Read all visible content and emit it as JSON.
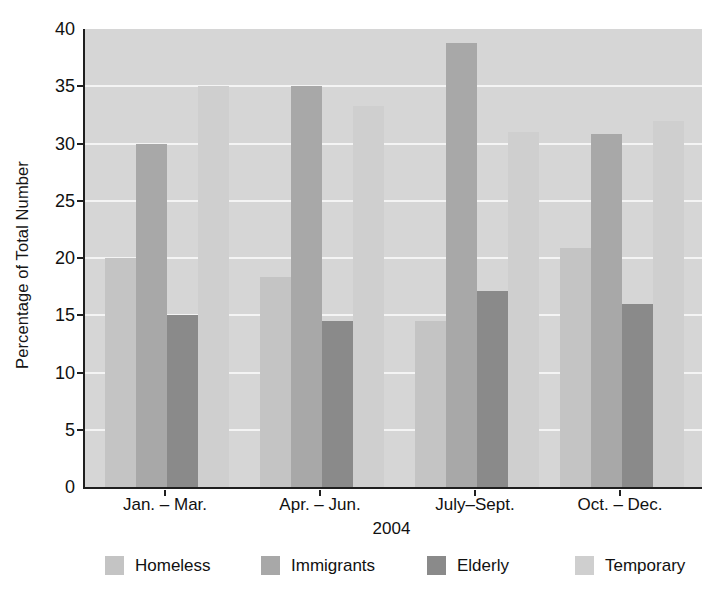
{
  "chart_data": {
    "type": "bar",
    "title": "",
    "title_note": "partially cropped at top edge, illegible",
    "xlabel": "2004",
    "ylabel": "Percentage of Total Number",
    "ylim": [
      0,
      40
    ],
    "ytick_step": 5,
    "yticks": [
      "0",
      "5",
      "10",
      "15",
      "20",
      "25",
      "30",
      "35",
      "40"
    ],
    "grid": true,
    "legend_position": "bottom",
    "categories": [
      "Jan. – Mar.",
      "Apr. – Jun.",
      "July–Sept.",
      "Oct. – Dec."
    ],
    "series": [
      {
        "name": "Homeless",
        "color": "#c4c4c4",
        "values": [
          20.0,
          18.3,
          14.5,
          20.9
        ]
      },
      {
        "name": "Immigrants",
        "color": "#a8a8a8",
        "values": [
          30.0,
          35.0,
          38.8,
          30.8
        ]
      },
      {
        "name": "Elderly",
        "color": "#8a8a8a",
        "values": [
          15.0,
          14.5,
          17.1,
          16.0
        ]
      },
      {
        "name": "Temporary",
        "color": "#cfcfcf",
        "values": [
          35.0,
          33.3,
          31.0,
          32.0
        ]
      }
    ],
    "plot_background": "#d6d6d6",
    "axis_color": "#1f1f1f",
    "gridline_color": "#f4f4f4"
  }
}
